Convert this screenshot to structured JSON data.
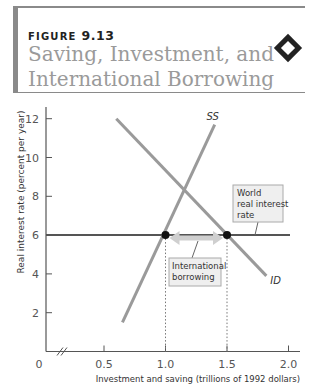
{
  "header": {
    "figure_prefix": "FIGURE",
    "figure_number": "9.13",
    "title_line1": "Saving, Investment, and",
    "title_line2": "International Borrowing",
    "icon": "diamond-icon"
  },
  "chart_data": {
    "type": "line",
    "title": "Saving, Investment, and International Borrowing",
    "xlabel": "Investment and saving (trillions of 1992 dollars)",
    "ylabel": "Real interest rate (percent per year)",
    "xlim": [
      0,
      2.1
    ],
    "ylim": [
      0,
      12.5
    ],
    "x_break": true,
    "x_ticks": [
      0.5,
      1.0,
      1.5,
      2.0
    ],
    "x_tick_labels": [
      "0.5",
      "1.0",
      "1.5",
      "2.0"
    ],
    "y_ticks": [
      2,
      4,
      6,
      8,
      10,
      12
    ],
    "y_tick_labels": [
      "2",
      "4",
      "6",
      "8",
      "10",
      "12"
    ],
    "origin_label": "0",
    "grid": false,
    "series": [
      {
        "name": "SS",
        "x": [
          0.65,
          1.4
        ],
        "y": [
          1.5,
          11.7
        ],
        "color": "#9a9a9a"
      },
      {
        "name": "ID",
        "x": [
          0.6,
          1.82
        ],
        "y": [
          12,
          3.9
        ],
        "color": "#9a9a9a"
      },
      {
        "name": "World real interest rate",
        "x": [
          0,
          2.0
        ],
        "y": [
          6,
          6
        ],
        "color": "#555555"
      }
    ],
    "points": [
      {
        "label": "saving at world rate",
        "x": 1.0,
        "y": 6
      },
      {
        "label": "investment at world rate",
        "x": 1.5,
        "y": 6
      }
    ],
    "annotations": [
      {
        "text": "World real interest rate",
        "lines": [
          "World",
          "real interest",
          "rate"
        ]
      },
      {
        "text": "International borrowing",
        "lines": [
          "International",
          "borrowing"
        ]
      },
      {
        "text": "SS"
      },
      {
        "text": "ID"
      }
    ],
    "arrow": {
      "from_x": 1.0,
      "to_x": 1.5,
      "y": 6,
      "label": "International borrowing"
    }
  }
}
